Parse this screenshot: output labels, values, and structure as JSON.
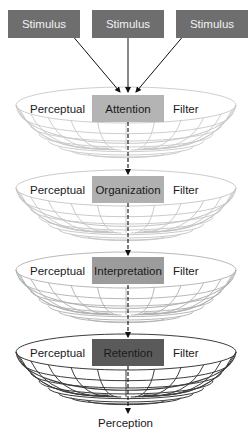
{
  "diagram": {
    "stimuli": [
      {
        "label": "Stimulus",
        "x": 8
      },
      {
        "label": "Stimulus",
        "x": 92
      },
      {
        "label": "Stimulus",
        "x": 176
      }
    ],
    "filters": [
      {
        "stage": "Attention",
        "left_label": "Perceptual",
        "right_label": "Filter",
        "rim_y": 105,
        "bottom_y": 150,
        "box_y": 95,
        "box_color": "#b4b4b4",
        "grid_color": "#c8c8c8"
      },
      {
        "stage": "Organization",
        "left_label": "Perceptual",
        "right_label": "Filter",
        "rim_y": 188,
        "bottom_y": 233,
        "box_y": 176,
        "box_color": "#b0b0b0",
        "grid_color": "#c4c4c4"
      },
      {
        "stage": "Interpretation",
        "left_label": "Perceptual",
        "right_label": "Filter",
        "rim_y": 270,
        "bottom_y": 315,
        "box_y": 257,
        "box_color": "#9c9c9c",
        "grid_color": "#b0b0b0"
      },
      {
        "stage": "Retention",
        "left_label": "Perceptual",
        "right_label": "Filter",
        "rim_y": 352,
        "bottom_y": 397,
        "box_y": 339,
        "box_color": "#5a5a5a",
        "grid_color": "#3c3c3c"
      }
    ],
    "output": "Perception"
  }
}
